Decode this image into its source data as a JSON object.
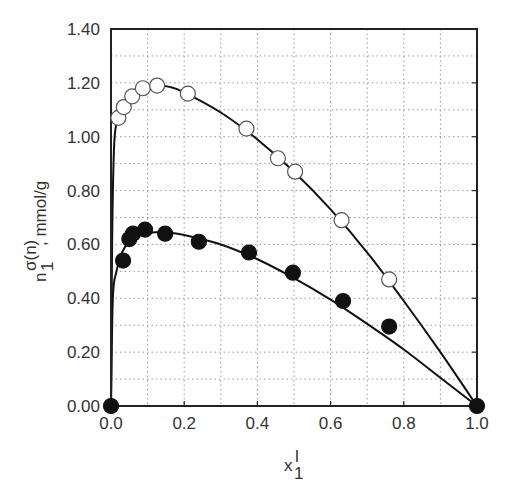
{
  "chart_data": {
    "type": "scatter",
    "title": "",
    "xlabel": "x_1^l",
    "xlabel_parts": {
      "base": "x",
      "sup": "l",
      "sub": "1"
    },
    "ylabel": "n_1^σ(n), mmol/g",
    "ylabel_parts": {
      "base": "n",
      "sup": "σ(n)",
      "sub": "1",
      "unit": ", mmol/g"
    },
    "xlim": [
      0.0,
      1.0
    ],
    "ylim": [
      0.0,
      1.4
    ],
    "x_ticks": [
      "0.0",
      "0.2",
      "0.4",
      "0.6",
      "0.8",
      "1.0"
    ],
    "y_ticks": [
      "0.00",
      "0.20",
      "0.40",
      "0.60",
      "0.80",
      "1.00",
      "1.20",
      "1.40"
    ],
    "grid": true,
    "grid_style": "dotted",
    "x_grid_step": 0.1,
    "y_grid_step": 0.1,
    "legend": null,
    "series": [
      {
        "name": "open circles",
        "marker": "open-circle",
        "x": [
          0.02,
          0.035,
          0.058,
          0.087,
          0.126,
          0.21,
          0.37,
          0.456,
          0.503,
          0.63,
          0.76
        ],
        "y": [
          1.07,
          1.11,
          1.15,
          1.18,
          1.19,
          1.16,
          1.03,
          0.92,
          0.87,
          0.69,
          0.47
        ],
        "fit_x": [
          0.0,
          0.003,
          0.008,
          0.015,
          0.03,
          0.05,
          0.08,
          0.12,
          0.16,
          0.2,
          0.3,
          0.4,
          0.5,
          0.6,
          0.7,
          0.8,
          0.9,
          1.0
        ],
        "fit_y": [
          0.0,
          0.6,
          0.95,
          1.05,
          1.11,
          1.15,
          1.18,
          1.19,
          1.185,
          1.165,
          1.09,
          0.99,
          0.87,
          0.73,
          0.57,
          0.39,
          0.2,
          0.0
        ]
      },
      {
        "name": "filled circles",
        "marker": "filled-circle",
        "x": [
          0.0,
          0.033,
          0.05,
          0.06,
          0.093,
          0.148,
          0.24,
          0.377,
          0.497,
          0.634,
          0.76,
          1.0
        ],
        "y": [
          0.0,
          0.54,
          0.62,
          0.64,
          0.655,
          0.64,
          0.61,
          0.57,
          0.495,
          0.39,
          0.295,
          0.0
        ],
        "fit_x": [
          0.0,
          0.005,
          0.015,
          0.03,
          0.05,
          0.08,
          0.12,
          0.16,
          0.2,
          0.3,
          0.4,
          0.5,
          0.6,
          0.7,
          0.8,
          0.9,
          1.0
        ],
        "fit_y": [
          0.0,
          0.4,
          0.5,
          0.57,
          0.61,
          0.635,
          0.645,
          0.643,
          0.635,
          0.6,
          0.545,
          0.475,
          0.395,
          0.305,
          0.21,
          0.105,
          0.0
        ]
      }
    ]
  },
  "colors": {
    "axis": "#222222",
    "grid": "#999999",
    "marker_fill_open": "#ffffff",
    "marker_fill_closed": "#111111",
    "line": "#111111"
  }
}
